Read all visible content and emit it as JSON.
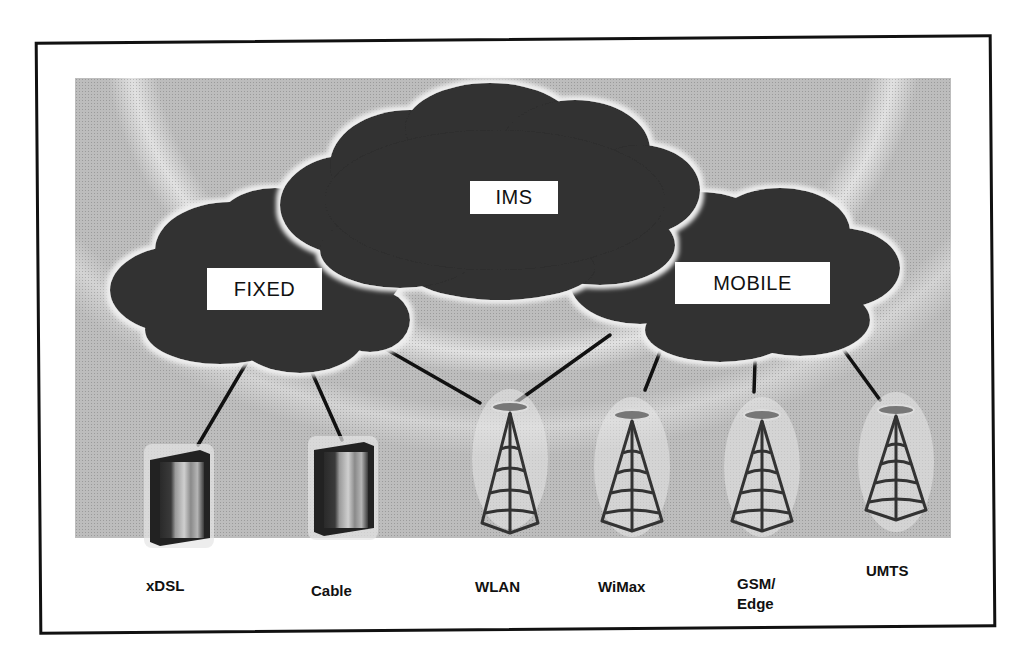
{
  "diagram": {
    "type": "network-architecture",
    "clouds": [
      {
        "id": "fixed",
        "label": "FIXED"
      },
      {
        "id": "ims",
        "label": "IMS"
      },
      {
        "id": "mobile",
        "label": "MOBILE"
      }
    ],
    "access_nodes": [
      {
        "id": "xdsl",
        "label": "xDSL",
        "icon": "server-box-icon",
        "connects_to": "fixed"
      },
      {
        "id": "cable",
        "label": "Cable",
        "icon": "server-box-icon",
        "connects_to": "fixed"
      },
      {
        "id": "wlan",
        "label": "WLAN",
        "icon": "antenna-tower-icon",
        "connects_to": [
          "fixed",
          "mobile"
        ]
      },
      {
        "id": "wimax",
        "label": "WiMax",
        "icon": "antenna-tower-icon",
        "connects_to": "mobile"
      },
      {
        "id": "gsm_edge",
        "label_line1": "GSM/",
        "label_line2": "Edge",
        "icon": "antenna-tower-icon",
        "connects_to": "mobile"
      },
      {
        "id": "umts",
        "label": "UMTS",
        "icon": "antenna-tower-icon",
        "connects_to": "mobile"
      }
    ],
    "colors": {
      "cloud": "#333333",
      "background": "#bdbdbd",
      "label_box": "#ffffff",
      "line": "#111111"
    }
  }
}
